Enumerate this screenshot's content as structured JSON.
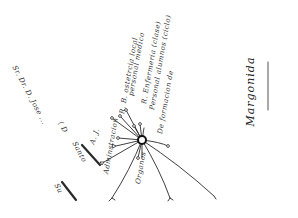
{
  "title": "Margonida",
  "hub": {
    "x": 142,
    "y": 140
  },
  "branches": [
    {
      "label": "Adminstracion",
      "x": 108,
      "y": 190,
      "angle": -80
    },
    {
      "label": "R. B. ostetrcia local",
      "x": 124,
      "y": 142,
      "angle": -80
    },
    {
      "label": "personal medico",
      "x": 133,
      "y": 118,
      "angle": -80
    },
    {
      "label": "R. Enfermeria (clase)",
      "x": 146,
      "y": 126,
      "angle": -80
    },
    {
      "label": "Personal alumnos (ciclo)",
      "x": 152,
      "y": 118,
      "angle": -80
    },
    {
      "label": "De formacion de",
      "x": 158,
      "y": 152,
      "angle": -80
    },
    {
      "label": "Organos",
      "x": 137,
      "y": 196,
      "angle": -80
    }
  ],
  "left_notes": [
    {
      "label": "Sr. Dr. D. Jose ...",
      "x": 14,
      "y": 64,
      "angle": 62
    },
    {
      "label": "( D",
      "x": 60,
      "y": 118,
      "angle": 62
    },
    {
      "label": "A. J.",
      "x": 84,
      "y": 160,
      "angle": -70
    },
    {
      "label": "Santo",
      "x": 72,
      "y": 146,
      "angle": 62
    },
    {
      "label": "Su",
      "x": 56,
      "y": 188,
      "angle": 62
    }
  ],
  "colors": {
    "ink": "#2a2a2a",
    "paper": "#ffffff"
  }
}
